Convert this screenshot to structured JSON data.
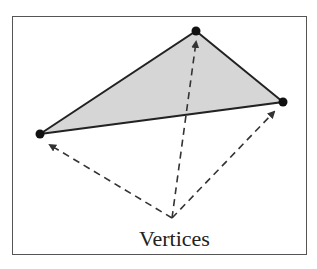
{
  "diagram": {
    "label": "Vertices",
    "triangle": {
      "vertices": [
        {
          "name": "top",
          "x": 196,
          "y": 31
        },
        {
          "name": "right",
          "x": 283,
          "y": 102
        },
        {
          "name": "left",
          "x": 40,
          "y": 134
        }
      ],
      "fill": "#d6d6d6",
      "stroke": "#222222"
    },
    "arrow_origin": {
      "x": 172,
      "y": 218
    },
    "colors": {
      "frame": "#555555",
      "arrows": "#333333"
    }
  }
}
